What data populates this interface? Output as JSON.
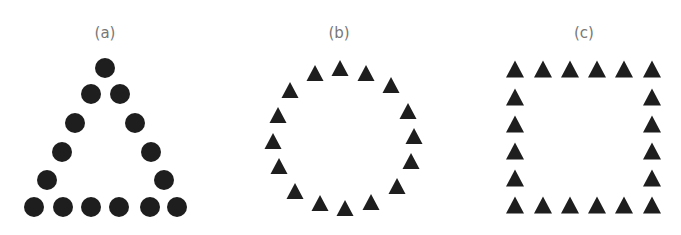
{
  "panels": [
    {
      "label": "(a)",
      "shape": "circle",
      "arrangement": "triangle",
      "label_pos": [
        105,
        38
      ],
      "radius": 10,
      "points": [
        [
          105,
          68
        ],
        [
          91,
          94
        ],
        [
          120,
          94
        ],
        [
          75,
          123
        ],
        [
          135,
          123
        ],
        [
          62,
          152
        ],
        [
          151,
          152
        ],
        [
          47,
          180
        ],
        [
          164,
          180
        ],
        [
          34,
          207
        ],
        [
          63,
          207
        ],
        [
          91,
          207
        ],
        [
          119,
          207
        ],
        [
          150,
          207
        ],
        [
          177,
          207
        ]
      ]
    },
    {
      "label": "(b)",
      "shape": "triangle",
      "arrangement": "circle",
      "label_pos": [
        339,
        38
      ],
      "size": 17,
      "points": [
        [
          340,
          68
        ],
        [
          366,
          73
        ],
        [
          391,
          85
        ],
        [
          408,
          111
        ],
        [
          414,
          136
        ],
        [
          411,
          161
        ],
        [
          397,
          186
        ],
        [
          371,
          202
        ],
        [
          345,
          208
        ],
        [
          320,
          203
        ],
        [
          295,
          191
        ],
        [
          279,
          166
        ],
        [
          273,
          141
        ],
        [
          278,
          115
        ],
        [
          290,
          90
        ],
        [
          315,
          73
        ]
      ]
    },
    {
      "label": "(c)",
      "shape": "triangle",
      "arrangement": "square",
      "label_pos": [
        584,
        38
      ],
      "size": 18,
      "points": [
        [
          515,
          69
        ],
        [
          543,
          69
        ],
        [
          570,
          69
        ],
        [
          597,
          69
        ],
        [
          624,
          69
        ],
        [
          652,
          69
        ],
        [
          515,
          97
        ],
        [
          652,
          97
        ],
        [
          515,
          124
        ],
        [
          652,
          124
        ],
        [
          515,
          151
        ],
        [
          652,
          151
        ],
        [
          515,
          178
        ],
        [
          652,
          178
        ],
        [
          515,
          205
        ],
        [
          543,
          205
        ],
        [
          570,
          205
        ],
        [
          597,
          205
        ],
        [
          624,
          205
        ],
        [
          652,
          205
        ]
      ]
    }
  ],
  "colors": {
    "shape": "#1e1e1e",
    "label": "#777777"
  }
}
